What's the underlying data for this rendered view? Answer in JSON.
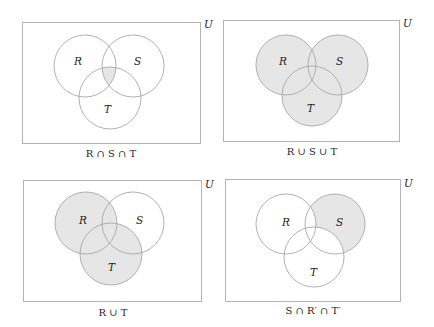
{
  "figure": {
    "universe_label": "U",
    "shade_color": "#e6e6e6",
    "panels": [
      {
        "id": "panel-1",
        "caption": "R ∩ S ∩ T",
        "shaded_region": "R ∩ S ∩ T",
        "set_labels": {
          "R": "R",
          "S": "S",
          "T": "T"
        }
      },
      {
        "id": "panel-2",
        "caption": "R ∪ S ∪ T",
        "shaded_region": "R ∪ S ∪ T",
        "set_labels": {
          "R": "R",
          "S": "S",
          "T": "T"
        }
      },
      {
        "id": "panel-3",
        "caption": "R ∪ T",
        "shaded_region": "R ∪ T",
        "set_labels": {
          "R": "R",
          "S": "S",
          "T": "T"
        }
      },
      {
        "id": "panel-4",
        "caption": "S ∩ R′ ∩ T′",
        "shaded_region": "S ∩ R′ ∩ T′",
        "set_labels": {
          "R": "R",
          "S": "S",
          "T": "T"
        }
      }
    ]
  }
}
